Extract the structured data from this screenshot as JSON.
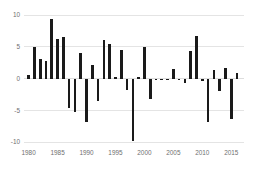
{
  "chart_data": {
    "type": "bar",
    "title": "",
    "subtitle": "",
    "xlabel": "",
    "ylabel": "",
    "xlim": [
      1979.2,
      2017.2
    ],
    "ylim": [
      -10,
      10
    ],
    "grid": true,
    "legend": null,
    "legend_position": "none",
    "bar_color": "#1a1a1a",
    "gridline_color": "#d8d8d8",
    "tick_label_color": "#6f6f6f",
    "y_ticks": [
      10,
      5,
      0,
      -5,
      -10
    ],
    "y_tick_labels": [
      "10",
      "5",
      "0",
      "-5",
      "-10"
    ],
    "x_ticks": [
      1980,
      1985,
      1990,
      1995,
      2000,
      2005,
      2010,
      2015
    ],
    "x_tick_labels": [
      "1980",
      "1985",
      "1990",
      "1995",
      "2000",
      "2005",
      "2010",
      "2015"
    ],
    "categories": [
      1980,
      1981,
      1982,
      1983,
      1984,
      1985,
      1986,
      1987,
      1988,
      1989,
      1990,
      1991,
      1992,
      1993,
      1994,
      1995,
      1996,
      1997,
      1998,
      1999,
      2000,
      2001,
      2002,
      2003,
      2004,
      2005,
      2006,
      2007,
      2008,
      2009,
      2010,
      2011,
      2012,
      2013,
      2014,
      2015,
      2016
    ],
    "values": [
      0.5,
      5.0,
      3.0,
      2.7,
      9.4,
      6.3,
      6.6,
      -4.6,
      -5.2,
      4.0,
      -6.8,
      2.2,
      -3.6,
      6.0,
      5.4,
      0.3,
      4.5,
      -1.8,
      -9.8,
      0.2,
      4.9,
      -3.2,
      -0.2,
      -0.3,
      -0.2,
      1.5,
      -0.2,
      -0.7,
      4.3,
      6.7,
      -0.4,
      -6.8,
      1.4,
      -1.9,
      1.6,
      -6.4,
      0.9
    ]
  }
}
